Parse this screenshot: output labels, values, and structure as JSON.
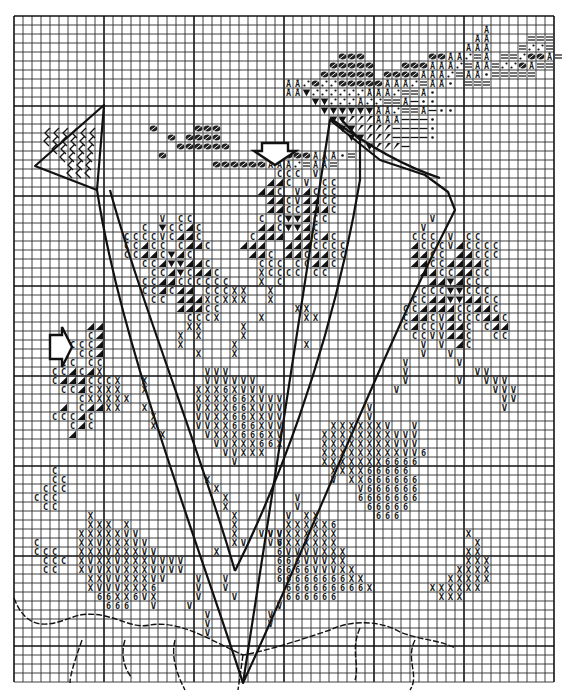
{
  "chart": {
    "type": "cross-stitch-pattern",
    "grid": {
      "origin_x": 14,
      "origin_y": 16,
      "cell": 9.0,
      "cols": 60,
      "rows": 74,
      "bold_every": 10,
      "line_color": "#2a2a2a",
      "bold_color": "#111111"
    },
    "symbol_legend": {
      "C": "C",
      "H": "◢",
      "V": "V",
      "X": "X",
      "6": "6",
      "T": "▼",
      "S": "⁄",
      "E": "=",
      "D": "•",
      "A": "Å",
      "F": "⊘",
      "M": "—",
      "P": "∴"
    },
    "clusters": [
      {
        "name": "top-right-bird-dark",
        "rows": [
          {
            "r": 12,
            "c": 20,
            "s": "FFF"
          },
          {
            "r": 13,
            "c": 19,
            "s": "FFFF"
          },
          {
            "r": 14,
            "c": 18,
            "s": "FFFFFF"
          },
          {
            "r": 15,
            "c": 30,
            "s": "FFFAAADE"
          },
          {
            "r": 16,
            "c": 22,
            "s": "FFFFFFAAAPEAAE"
          }
        ]
      }
    ],
    "pattern_rows": [
      {
        "r": 1,
        "c": 52,
        "s": "A"
      },
      {
        "r": 2,
        "c": 51,
        "s": "AA"
      },
      {
        "r": 2,
        "c": 57,
        "s": "EEE"
      },
      {
        "r": 3,
        "c": 50,
        "s": "AAA"
      },
      {
        "r": 3,
        "c": 56,
        "s": "EPPE"
      },
      {
        "r": 4,
        "c": 36,
        "s": "FFF"
      },
      {
        "r": 4,
        "c": 46,
        "s": "FFAAPEA"
      },
      {
        "r": 4,
        "c": 54,
        "s": "EEPFFAE"
      },
      {
        "r": 5,
        "c": 35,
        "s": "FFFFF"
      },
      {
        "r": 5,
        "c": 43,
        "s": "FFFAAAPEAAEPPFAEE"
      },
      {
        "r": 6,
        "c": 34,
        "s": "FFFFFF"
      },
      {
        "r": 6,
        "c": 41,
        "s": "FFFFAAAPEAAD"
      },
      {
        "r": 6,
        "c": 53,
        "s": "EEEEE"
      },
      {
        "r": 7,
        "c": 30,
        "s": "AAPFPPFFFFFAAAPEAAD"
      },
      {
        "r": 7,
        "c": 50,
        "s": "EEE"
      },
      {
        "r": 8,
        "c": 30,
        "s": "AATPPPPPPAAAPEEAD"
      },
      {
        "r": 9,
        "c": 33,
        "s": "TTPPPAPPEEAMDD"
      },
      {
        "r": 10,
        "c": 34,
        "s": "TTTTTTAAPEEAMDD"
      },
      {
        "r": 11,
        "c": 35,
        "s": "TTSSSAAAMMMD"
      },
      {
        "r": 12,
        "c": 36,
        "s": "TTSSSSMMMMD"
      },
      {
        "r": 13,
        "c": 37,
        "s": "TTSSSMMMMD"
      },
      {
        "r": 14,
        "c": 39,
        "s": "TSSSM"
      },
      {
        "r": 12,
        "c": 15,
        "s": "F"
      },
      {
        "r": 13,
        "c": 17,
        "s": "F"
      },
      {
        "r": 15,
        "c": 16,
        "s": "F"
      },
      {
        "r": 17,
        "c": 29,
        "s": "CCC"
      },
      {
        "r": 17,
        "c": 33,
        "s": "V"
      },
      {
        "r": 18,
        "c": 28,
        "s": "HHC"
      },
      {
        "r": 18,
        "c": 32,
        "s": "V"
      },
      {
        "r": 18,
        "c": 34,
        "s": "CC"
      },
      {
        "r": 19,
        "c": 27,
        "s": "HHC"
      },
      {
        "r": 19,
        "c": 31,
        "s": "VHCCC"
      },
      {
        "r": 20,
        "c": 28,
        "s": "HHCVHHCC"
      },
      {
        "r": 21,
        "c": 28,
        "s": "HHCCHHHC"
      },
      {
        "r": 22,
        "c": 27,
        "s": "C"
      },
      {
        "r": 22,
        "c": 29,
        "s": "CTTHCC"
      },
      {
        "r": 23,
        "c": 27,
        "s": "HHCTTHC"
      },
      {
        "r": 24,
        "c": 26,
        "s": "CHHH"
      },
      {
        "r": 24,
        "c": 31,
        "s": "HHCHC"
      },
      {
        "r": 25,
        "c": 25,
        "s": "HHH"
      },
      {
        "r": 25,
        "c": 30,
        "s": "HHHCCCC"
      },
      {
        "r": 26,
        "c": 26,
        "s": "HHC"
      },
      {
        "r": 26,
        "c": 30,
        "s": "HHCHHCC"
      },
      {
        "r": 27,
        "c": 27,
        "s": "CCC"
      },
      {
        "r": 27,
        "c": 31,
        "s": "CCHHC"
      },
      {
        "r": 28,
        "c": 27,
        "s": "XCCCC"
      },
      {
        "r": 28,
        "c": 33,
        "s": "CC"
      },
      {
        "r": 29,
        "c": 27,
        "s": "X"
      },
      {
        "r": 29,
        "c": 29,
        "s": "C"
      },
      {
        "r": 22,
        "c": 16,
        "s": "V"
      },
      {
        "r": 22,
        "c": 18,
        "s": "CC"
      },
      {
        "r": 23,
        "c": 14,
        "s": "C"
      },
      {
        "r": 23,
        "c": 16,
        "s": "T"
      },
      {
        "r": 23,
        "c": 17,
        "s": "CCHC"
      },
      {
        "r": 24,
        "c": 12,
        "s": "CCCCVCHHC"
      },
      {
        "r": 25,
        "c": 12,
        "s": "CCHCC"
      },
      {
        "r": 25,
        "c": 18,
        "s": "CHHC"
      },
      {
        "r": 26,
        "c": 12,
        "s": "CCHHCTHC"
      },
      {
        "r": 27,
        "c": 14,
        "s": "CCHTTHHC"
      },
      {
        "r": 28,
        "c": 15,
        "s": "CCHTCHHC"
      },
      {
        "r": 29,
        "c": 14,
        "s": "CCHHCCCCCC"
      },
      {
        "r": 30,
        "c": 14,
        "s": "CCHCHH"
      },
      {
        "r": 30,
        "c": 21,
        "s": "CCC"
      },
      {
        "r": 31,
        "c": 15,
        "s": "CC"
      },
      {
        "r": 31,
        "c": 18,
        "s": "HHHXC"
      },
      {
        "r": 32,
        "c": 18,
        "s": "HHHCC"
      },
      {
        "r": 33,
        "c": 19,
        "s": "CCC"
      },
      {
        "r": 34,
        "c": 19,
        "s": "XX"
      },
      {
        "r": 35,
        "c": 18,
        "s": "X"
      },
      {
        "r": 35,
        "c": 20,
        "s": "X"
      },
      {
        "r": 36,
        "c": 18,
        "s": "X"
      },
      {
        "r": 37,
        "c": 20,
        "s": "X"
      },
      {
        "r": 30,
        "c": 24,
        "s": "XX"
      },
      {
        "r": 30,
        "c": 28,
        "s": "X"
      },
      {
        "r": 31,
        "c": 23,
        "s": "XXX"
      },
      {
        "r": 31,
        "c": 28,
        "s": "X"
      },
      {
        "r": 32,
        "c": 31,
        "s": "XX"
      },
      {
        "r": 33,
        "c": 22,
        "s": "X"
      },
      {
        "r": 33,
        "c": 27,
        "s": "X"
      },
      {
        "r": 33,
        "c": 32,
        "s": "XX"
      },
      {
        "r": 34,
        "c": 25,
        "s": "X"
      },
      {
        "r": 35,
        "c": 25,
        "s": "X"
      },
      {
        "r": 36,
        "c": 24,
        "s": "X"
      },
      {
        "r": 37,
        "c": 24,
        "s": "X"
      },
      {
        "r": 36,
        "c": 32,
        "s": "X"
      },
      {
        "r": 22,
        "c": 46,
        "s": "V"
      },
      {
        "r": 23,
        "c": 45,
        "s": "V"
      },
      {
        "r": 24,
        "c": 44,
        "s": "CCC"
      },
      {
        "r": 24,
        "c": 48,
        "s": "V"
      },
      {
        "r": 24,
        "c": 50,
        "s": "CC"
      },
      {
        "r": 25,
        "c": 44,
        "s": "HCCCVHCCCC"
      },
      {
        "r": 26,
        "c": 44,
        "s": "HHCC"
      },
      {
        "r": 26,
        "c": 49,
        "s": "HHCCC"
      },
      {
        "r": 27,
        "c": 44,
        "s": "HHCCHHHHC"
      },
      {
        "r": 28,
        "c": 45,
        "s": "HHCCHHCC"
      },
      {
        "r": 29,
        "c": 46,
        "s": "HHTHCC"
      },
      {
        "r": 30,
        "c": 45,
        "s": "CCCTTCCC"
      },
      {
        "r": 31,
        "c": 44,
        "s": "CCHHTTHHCC"
      },
      {
        "r": 32,
        "c": 43,
        "s": "CCHHHHCCHHC"
      },
      {
        "r": 33,
        "c": 43,
        "s": "CHHCVHCCCHHC"
      },
      {
        "r": 34,
        "c": 43,
        "s": "CHCCVHHC"
      },
      {
        "r": 34,
        "c": 52,
        "s": "CHH"
      },
      {
        "r": 35,
        "c": 44,
        "s": "CCVVHHC"
      },
      {
        "r": 35,
        "c": 53,
        "s": "CC"
      },
      {
        "r": 36,
        "c": 45,
        "s": "V"
      },
      {
        "r": 36,
        "c": 47,
        "s": "V"
      },
      {
        "r": 36,
        "c": 49,
        "s": "HC"
      },
      {
        "r": 37,
        "c": 45,
        "s": "V"
      },
      {
        "r": 37,
        "c": 48,
        "s": "V"
      },
      {
        "r": 38,
        "c": 43,
        "s": "V"
      },
      {
        "r": 38,
        "c": 49,
        "s": "V"
      },
      {
        "r": 39,
        "c": 43,
        "s": "V"
      },
      {
        "r": 39,
        "c": 51,
        "s": "VV"
      },
      {
        "r": 40,
        "c": 43,
        "s": "V"
      },
      {
        "r": 40,
        "c": 49,
        "s": "V"
      },
      {
        "r": 40,
        "c": 52,
        "s": "VVV"
      },
      {
        "r": 41,
        "c": 42,
        "s": "V"
      },
      {
        "r": 41,
        "c": 53,
        "s": "VVV"
      },
      {
        "r": 42,
        "c": 54,
        "s": "VV"
      },
      {
        "r": 43,
        "c": 54,
        "s": "V"
      },
      {
        "r": 34,
        "c": 8,
        "s": "HH"
      },
      {
        "r": 35,
        "c": 8,
        "s": "CH"
      },
      {
        "r": 36,
        "c": 6,
        "s": "CCCH"
      },
      {
        "r": 37,
        "c": 7,
        "s": "CCH"
      },
      {
        "r": 38,
        "c": 5,
        "s": "CC"
      },
      {
        "r": 38,
        "c": 8,
        "s": "CC"
      },
      {
        "r": 39,
        "c": 4,
        "s": "CCHCHX"
      },
      {
        "r": 40,
        "c": 4,
        "s": "CHHHCCCX"
      },
      {
        "r": 40,
        "c": 14,
        "s": "X"
      },
      {
        "r": 41,
        "c": 5,
        "s": "CCHCXXX"
      },
      {
        "r": 41,
        "c": 14,
        "s": "X"
      },
      {
        "r": 42,
        "c": 7,
        "s": "CXXXXX"
      },
      {
        "r": 43,
        "c": 5,
        "s": "H"
      },
      {
        "r": 43,
        "c": 7,
        "s": "CHHXX"
      },
      {
        "r": 43,
        "c": 14,
        "s": "X"
      },
      {
        "r": 44,
        "c": 4,
        "s": "CCCHC"
      },
      {
        "r": 44,
        "c": 15,
        "s": "X"
      },
      {
        "r": 45,
        "c": 6,
        "s": "CHC"
      },
      {
        "r": 45,
        "c": 15,
        "s": "X"
      },
      {
        "r": 46,
        "c": 6,
        "s": "H"
      },
      {
        "r": 46,
        "c": 16,
        "s": "X"
      },
      {
        "r": 39,
        "c": 21,
        "s": "VVV"
      },
      {
        "r": 40,
        "c": 21,
        "s": "VVVVVV"
      },
      {
        "r": 41,
        "c": 20,
        "s": "XXX6XVVV"
      },
      {
        "r": 42,
        "c": 20,
        "s": "XXXX66XVVV"
      },
      {
        "r": 43,
        "c": 20,
        "s": "VXXX66XVVV"
      },
      {
        "r": 44,
        "c": 20,
        "s": "VVXX66XXVV"
      },
      {
        "r": 45,
        "c": 20,
        "s": "VVXX666XVV"
      },
      {
        "r": 46,
        "c": 21,
        "s": "VXXX666XV"
      },
      {
        "r": 47,
        "c": 22,
        "s": "VVXXX66X"
      },
      {
        "r": 48,
        "c": 23,
        "s": "VVXXX"
      },
      {
        "r": 49,
        "c": 24,
        "s": "V"
      },
      {
        "r": 43,
        "c": 39,
        "s": "V"
      },
      {
        "r": 44,
        "c": 39,
        "s": "V"
      },
      {
        "r": 45,
        "c": 35,
        "s": "XXXXXXV"
      },
      {
        "r": 45,
        "c": 44,
        "s": "V"
      },
      {
        "r": 46,
        "c": 34,
        "s": "XXXXXXXXVVV"
      },
      {
        "r": 47,
        "c": 34,
        "s": "XXXXXXXXVVV"
      },
      {
        "r": 48,
        "c": 34,
        "s": "XXXXXXXXXVV6"
      },
      {
        "r": 49,
        "c": 34,
        "s": "XXXXXXX6666"
      },
      {
        "r": 50,
        "c": 35,
        "s": "XXXX66666"
      },
      {
        "r": 51,
        "c": 35,
        "s": "V"
      },
      {
        "r": 51,
        "c": 37,
        "s": "XX666666"
      },
      {
        "r": 52,
        "c": 38,
        "s": "V666666"
      },
      {
        "r": 53,
        "c": 38,
        "s": "6666666"
      },
      {
        "r": 54,
        "c": 39,
        "s": "66666"
      },
      {
        "r": 55,
        "c": 40,
        "s": "666"
      },
      {
        "r": 50,
        "c": 4,
        "s": "C"
      },
      {
        "r": 51,
        "c": 4,
        "s": "CC"
      },
      {
        "r": 52,
        "c": 3,
        "s": "CCC"
      },
      {
        "r": 53,
        "c": 2,
        "s": "CCC"
      },
      {
        "r": 54,
        "c": 3,
        "s": "CC"
      },
      {
        "r": 58,
        "c": 2,
        "s": "C"
      },
      {
        "r": 59,
        "c": 2,
        "s": "CCC"
      },
      {
        "r": 60,
        "c": 3,
        "s": "CCC"
      },
      {
        "r": 61,
        "c": 3,
        "s": "CC"
      },
      {
        "r": 55,
        "c": 8,
        "s": "X"
      },
      {
        "r": 56,
        "c": 8,
        "s": "XXX"
      },
      {
        "r": 56,
        "c": 12,
        "s": "X"
      },
      {
        "r": 57,
        "c": 7,
        "s": "XXXXXVV"
      },
      {
        "r": 58,
        "c": 7,
        "s": "XXVXXXVV"
      },
      {
        "r": 59,
        "c": 7,
        "s": "XXXVXXXVV"
      },
      {
        "r": 60,
        "c": 7,
        "s": "XVXXVXXXVV"
      },
      {
        "r": 61,
        "c": 7,
        "s": "XVVXVXXXV"
      },
      {
        "r": 62,
        "c": 8,
        "s": "XXVVXXXVV"
      },
      {
        "r": 63,
        "c": 8,
        "s": "XVVVXXX6"
      },
      {
        "r": 64,
        "c": 9,
        "s": "66XX6VX"
      },
      {
        "r": 65,
        "c": 10,
        "s": "666"
      },
      {
        "r": 65,
        "c": 15,
        "s": "V"
      },
      {
        "r": 51,
        "c": 21,
        "s": "X"
      },
      {
        "r": 52,
        "c": 22,
        "s": "X"
      },
      {
        "r": 53,
        "c": 23,
        "s": "X"
      },
      {
        "r": 54,
        "c": 23,
        "s": "X"
      },
      {
        "r": 55,
        "c": 24,
        "s": "X"
      },
      {
        "r": 56,
        "c": 24,
        "s": "X"
      },
      {
        "r": 57,
        "c": 24,
        "s": "X"
      },
      {
        "r": 58,
        "c": 24,
        "s": "XV"
      },
      {
        "r": 57,
        "c": 27,
        "s": "VVV"
      },
      {
        "r": 58,
        "c": 28,
        "s": "VV"
      },
      {
        "r": 59,
        "c": 22,
        "s": "X"
      },
      {
        "r": 53,
        "c": 31,
        "s": "V"
      },
      {
        "r": 54,
        "c": 31,
        "s": "V"
      },
      {
        "r": 55,
        "c": 30,
        "s": "V"
      },
      {
        "r": 55,
        "c": 32,
        "s": "XX"
      },
      {
        "r": 56,
        "c": 30,
        "s": "XXXXX6"
      },
      {
        "r": 57,
        "c": 28,
        "s": "VV"
      },
      {
        "r": 57,
        "c": 30,
        "s": "XXXXXX"
      },
      {
        "r": 58,
        "c": 29,
        "s": "6XXXXXX"
      },
      {
        "r": 59,
        "c": 29,
        "s": "6VVVVXXX"
      },
      {
        "r": 60,
        "c": 29,
        "s": "666VVVXX"
      },
      {
        "r": 61,
        "c": 29,
        "s": "6666VVVXX"
      },
      {
        "r": 62,
        "c": 29,
        "s": "66666666XX"
      },
      {
        "r": 63,
        "c": 30,
        "s": "666666666X"
      },
      {
        "r": 64,
        "c": 30,
        "s": "666666"
      },
      {
        "r": 65,
        "c": 29,
        "s": "V"
      },
      {
        "r": 66,
        "c": 28,
        "s": "V"
      },
      {
        "r": 67,
        "c": 28,
        "s": "V"
      },
      {
        "r": 60,
        "c": 17,
        "s": "VV"
      },
      {
        "r": 61,
        "c": 16,
        "s": "VVV"
      },
      {
        "r": 62,
        "c": 20,
        "s": "V"
      },
      {
        "r": 63,
        "c": 20,
        "s": "V"
      },
      {
        "r": 64,
        "c": 20,
        "s": "V"
      },
      {
        "r": 65,
        "c": 19,
        "s": "V"
      },
      {
        "r": 66,
        "c": 21,
        "s": "V"
      },
      {
        "r": 67,
        "c": 21,
        "s": "V"
      },
      {
        "r": 68,
        "c": 21,
        "s": "V"
      },
      {
        "r": 62,
        "c": 23,
        "s": "V"
      },
      {
        "r": 63,
        "c": 23,
        "s": "V"
      },
      {
        "r": 64,
        "c": 24,
        "s": "V"
      },
      {
        "r": 57,
        "c": 50,
        "s": "X"
      },
      {
        "r": 58,
        "c": 51,
        "s": "X"
      },
      {
        "r": 59,
        "c": 50,
        "s": "XX"
      },
      {
        "r": 60,
        "c": 50,
        "s": "XXX"
      },
      {
        "r": 61,
        "c": 49,
        "s": "XXXX"
      },
      {
        "r": 62,
        "c": 48,
        "s": "XXXXX"
      },
      {
        "r": 63,
        "c": 46,
        "s": "XXXXXX"
      },
      {
        "r": 64,
        "c": 47,
        "s": "XXX"
      }
    ],
    "outlines": {
      "left_leaf_tip": "M 35 166 L 104 105 L 97 190 Z",
      "left_leaf_hatch": "chevrons",
      "main_v_left_stroke": "M 97 190 C 120 340, 190 520, 243 683",
      "main_v_inner_left": "M 110 190 C 140 300, 200 450, 235 571",
      "main_v_inner_right": "M 235 571 C 270 500, 330 360, 360 180 L 360 140 L 340 118",
      "main_v_right_stroke": "M 243 683 C 300 560, 380 360, 440 240 L 455 210 L 448 192 L 425 175 L 380 160 L 330 120 Z",
      "right_leaf_curl": "M 330 118 C 360 140, 400 165, 440 178",
      "roots": [
        "M 14 598 C 30 640, 60 620, 80 615 C 110 610, 130 630, 150 625 C 180 620, 210 640, 243 655 C 270 650, 300 640, 330 630 C 350 620, 380 620, 400 632 C 420 640, 440 640, 455 648",
        "M 82 640 C 75 660, 70 675, 70 683",
        "M 125 640 C 120 655, 125 670, 132 678",
        "M 175 640 C 170 660, 180 680, 185 690",
        "M 243 655 L 238 690",
        "M 360 628 C 350 650, 360 665, 355 680",
        "M 415 640 C 405 660, 420 675, 410 690"
      ]
    },
    "markers": [
      {
        "name": "down-arrow-marker",
        "x": 262,
        "y": 143,
        "dir": "down"
      },
      {
        "name": "right-arrow-marker",
        "x": 50,
        "y": 335,
        "dir": "right"
      }
    ]
  }
}
